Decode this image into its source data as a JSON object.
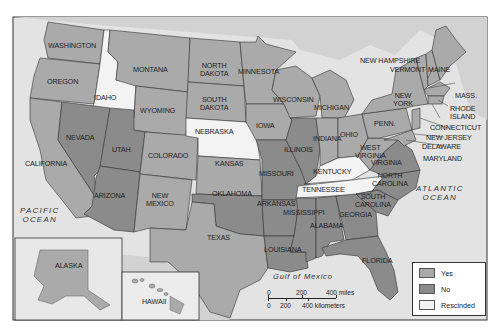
{
  "colors": {
    "yes": "#aaaaaa",
    "no": "#8b8b8b",
    "rescinded": "#f3f3f3",
    "water": "#dcdcdc",
    "foreign_land": "#cfcfcf",
    "frame": "#333333"
  },
  "states": [
    {
      "name": "WASHINGTON",
      "status": "yes"
    },
    {
      "name": "OREGON",
      "status": "yes"
    },
    {
      "name": "IDAHO",
      "status": "rescinded"
    },
    {
      "name": "MONTANA",
      "status": "yes"
    },
    {
      "name": "WYOMING",
      "status": "yes"
    },
    {
      "name": "NORTH DAKOTA",
      "status": "yes"
    },
    {
      "name": "SOUTH DAKOTA",
      "status": "rescinded-label-yes"
    },
    {
      "name": "MINNESOTA",
      "status": "yes"
    },
    {
      "name": "NEBRASKA",
      "status": "rescinded"
    },
    {
      "name": "IOWA",
      "status": "yes"
    },
    {
      "name": "WISCONSIN",
      "status": "yes"
    },
    {
      "name": "MICHIGAN",
      "status": "yes"
    },
    {
      "name": "CALIFORNIA",
      "status": "yes"
    },
    {
      "name": "NEVADA",
      "status": "no"
    },
    {
      "name": "UTAH",
      "status": "no"
    },
    {
      "name": "COLORADO",
      "status": "yes"
    },
    {
      "name": "KANSAS",
      "status": "yes"
    },
    {
      "name": "ILLINOIS",
      "status": "no"
    },
    {
      "name": "INDIANA",
      "status": "yes"
    },
    {
      "name": "OHIO",
      "status": "yes"
    },
    {
      "name": "ARIZONA",
      "status": "no"
    },
    {
      "name": "NEW MEXICO",
      "status": "yes"
    },
    {
      "name": "OKLAHOMA",
      "status": "no"
    },
    {
      "name": "MISSOURI",
      "status": "no"
    },
    {
      "name": "KENTUCKY",
      "status": "rescinded"
    },
    {
      "name": "TENNESSEE",
      "status": "rescinded"
    },
    {
      "name": "TEXAS",
      "status": "yes"
    },
    {
      "name": "ARKANSAS",
      "status": "no"
    },
    {
      "name": "LOUISIANA",
      "status": "no"
    },
    {
      "name": "MISSISSIPPI",
      "status": "no"
    },
    {
      "name": "ALABAMA",
      "status": "no"
    },
    {
      "name": "GEORGIA",
      "status": "no"
    },
    {
      "name": "FLORIDA",
      "status": "no"
    },
    {
      "name": "SOUTH CAROLINA",
      "status": "no"
    },
    {
      "name": "NORTH CAROLINA",
      "status": "no"
    },
    {
      "name": "VIRGINIA",
      "status": "no"
    },
    {
      "name": "WEST VIRGINIA",
      "status": "yes"
    },
    {
      "name": "PENN.",
      "status": "yes"
    },
    {
      "name": "NEW YORK",
      "status": "yes"
    },
    {
      "name": "VERMONT",
      "status": "yes"
    },
    {
      "name": "NEW HAMPSHIRE",
      "status": "yes"
    },
    {
      "name": "MAINE",
      "status": "yes"
    },
    {
      "name": "MASS.",
      "status": "yes"
    },
    {
      "name": "RHODE ISLAND",
      "status": "yes"
    },
    {
      "name": "CONNECTICUT",
      "status": "yes"
    },
    {
      "name": "NEW JERSEY",
      "status": "yes"
    },
    {
      "name": "DELAWARE",
      "status": "yes"
    },
    {
      "name": "MARYLAND",
      "status": "yes"
    },
    {
      "name": "ALASKA",
      "status": "yes"
    },
    {
      "name": "HAWAII",
      "status": "yes"
    }
  ],
  "labels": {
    "washington": "WASHINGTON",
    "oregon": "OREGON",
    "idaho": "IDAHO",
    "montana": "MONTANA",
    "wyoming": "WYOMING",
    "north_dakota_1": "NORTH",
    "north_dakota_2": "DAKOTA",
    "south_dakota_1": "SOUTH",
    "south_dakota_2": "DAKOTA",
    "minnesota": "MINNESOTA",
    "nebraska": "NEBRASKA",
    "iowa": "IOWA",
    "wisconsin": "WISCONSIN",
    "michigan": "MICHIGAN",
    "california": "CALIFORNIA",
    "nevada": "NEVADA",
    "utah": "UTAH",
    "colorado": "COLORADO",
    "kansas": "KANSAS",
    "illinois": "ILLINOIS",
    "indiana": "INDIANA",
    "ohio": "OHIO",
    "arizona": "ARIZONA",
    "new_mexico_1": "NEW",
    "new_mexico_2": "MEXICO",
    "oklahoma": "OKLAHOMA",
    "missouri": "MISSOURI",
    "kentucky": "KENTUCKY",
    "tennessee": "TENNESSEE",
    "texas": "TEXAS",
    "arkansas": "ARKANSAS",
    "louisiana": "LOUISIANA",
    "mississippi": "MISSISSIPPI",
    "alabama": "ALABAMA",
    "georgia": "GEORGIA",
    "florida": "FLORIDA",
    "south_carolina_1": "SOUTH",
    "south_carolina_2": "CAROLINA",
    "north_carolina_1": "NORTH",
    "north_carolina_2": "CAROLINA",
    "virginia": "VIRGINIA",
    "west_virginia_1": "WEST",
    "west_virginia_2": "VIRGINIA",
    "penn": "PENN.",
    "new_york_1": "NEW",
    "new_york_2": "YORK",
    "vermont": "VERMONT",
    "new_hampshire": "NEW HAMPSHIRE",
    "maine": "MAINE",
    "mass": "MASS.",
    "rhode_island_1": "RHODE",
    "rhode_island_2": "ISLAND",
    "connecticut": "CONNECTICUT",
    "new_jersey": "NEW JERSEY",
    "delaware": "DELAWARE",
    "maryland": "MARYLAND",
    "alaska": "ALASKA",
    "hawaii": "HAWAII",
    "pacific_1": "PACIFIC",
    "pacific_2": "OCEAN",
    "atlantic_1": "ATLANTIC",
    "atlantic_2": "OCEAN",
    "gulf": "Gulf of Mexico"
  },
  "legend": {
    "items": [
      {
        "label": "Yes",
        "color": "#aaaaaa"
      },
      {
        "label": "No",
        "color": "#8b8b8b"
      },
      {
        "label": "Rescinded",
        "color": "#f3f3f3"
      }
    ]
  },
  "scale_bar": {
    "miles_0": "0",
    "miles_200": "200",
    "miles_400": "400 miles",
    "km_0": "0",
    "km_200": "200",
    "km_400": "400 kilometers"
  }
}
